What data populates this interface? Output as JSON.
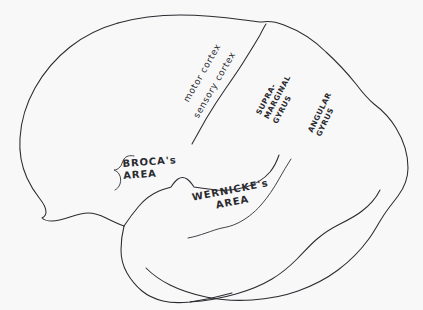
{
  "figure": {
    "kind": "hand-drawn-lateral-brain-diagram",
    "background_color": "#f8f8f9",
    "ink_color": "#2b2b30"
  },
  "labels": {
    "motor_cortex": "motor cortex",
    "sensory_cortex": "sensory cortex",
    "brocas_area": {
      "line1": "BROCA's",
      "line2": "AREA"
    },
    "wernickes_area": {
      "line1": "WERNICKE's",
      "line2": "AREA"
    },
    "supramarginal_gyrus": {
      "line1": "SUPRA-",
      "line2": "MARGINAL",
      "line3": "GYRUS"
    },
    "angular_gyrus": {
      "line1": "ANGULAR",
      "line2": "GYRUS"
    }
  }
}
